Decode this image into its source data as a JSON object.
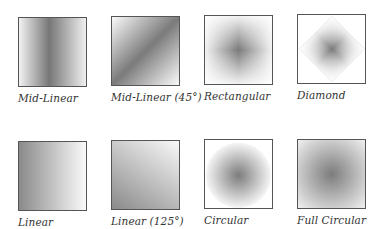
{
  "gradients": [
    {
      "label": "Mid-Linear",
      "type": "mid-linear",
      "angle": 0
    },
    {
      "label": "Mid-Linear (45°)",
      "type": "mid-linear",
      "angle": 45
    },
    {
      "label": "Rectangular",
      "type": "rectangular"
    },
    {
      "label": "Diamond",
      "type": "diamond"
    },
    {
      "label": "Linear",
      "type": "linear",
      "angle": 0
    },
    {
      "label": "Linear (125°)",
      "type": "linear",
      "angle": 125
    },
    {
      "label": "Circular",
      "type": "circular"
    },
    {
      "label": "Full Circular",
      "type": "full-circular"
    }
  ],
  "colors": {
    "dark": "#7a7a7a",
    "light": "#f5f5f5",
    "border": "#555555"
  }
}
